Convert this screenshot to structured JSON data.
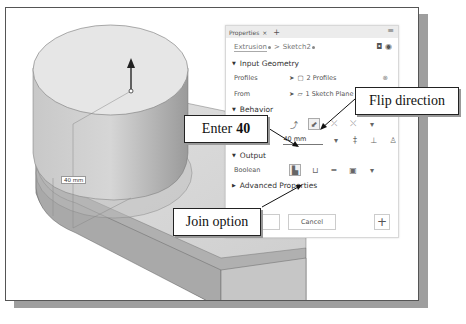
{
  "panel": {
    "tab_label": "Properties",
    "tab_close": "×",
    "tab_add": "+",
    "menu_icon": "≡",
    "breadcrumb": [
      "Extrusion",
      "Sketch2"
    ],
    "breadcrumb_sep": ">",
    "header_tools": "◘ ◉",
    "sections": {
      "input_geometry": "Input Geometry",
      "behavior": "Behavior",
      "output": "Output",
      "advanced": "Advanced Properties"
    },
    "rows": {
      "profiles": {
        "label": "Profiles",
        "value": "2 Profiles"
      },
      "from": {
        "label": "From",
        "value": "1 Sketch Plane"
      },
      "distance_a": {
        "label": "Distance A",
        "value": "40 mm"
      },
      "boolean": {
        "label": "Boolean"
      }
    },
    "buttons": {
      "ok": "",
      "cancel": "Cancel",
      "add": "+"
    }
  },
  "callouts": {
    "enter": {
      "prefix": "Enter",
      "value": "40"
    },
    "flip": "Flip direction",
    "join": "Join option"
  },
  "viewport": {
    "dimension_label": "40 mm"
  },
  "colors": {
    "panel_bg": "#ffffff",
    "titlebar_bg": "#ececec",
    "model_gray": "#b5b5b5"
  }
}
